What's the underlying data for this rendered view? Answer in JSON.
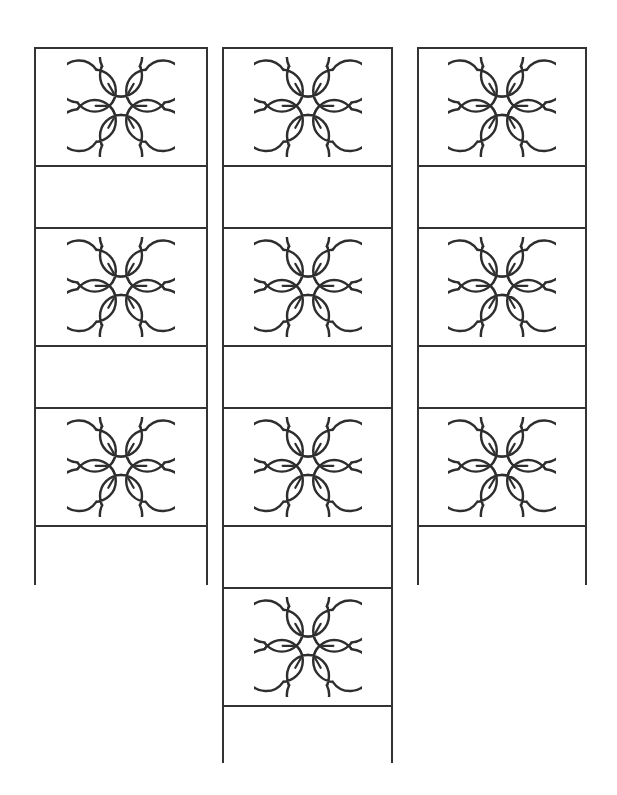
{
  "page": {
    "background_color": "#ffffff",
    "outline_color": "#333333",
    "flower_stroke_color": "#2e2e2e",
    "width": 617,
    "height": 795
  },
  "worksheet": {
    "strips": [
      {
        "name": "left-strip",
        "x": 34,
        "y": 47,
        "width": 174,
        "height": 538,
        "cells": [
          {
            "type": "flower",
            "icon": "flower-icon",
            "label": ""
          },
          {
            "type": "blank",
            "icon": "",
            "label": ""
          },
          {
            "type": "flower",
            "icon": "flower-icon",
            "label": ""
          },
          {
            "type": "blank",
            "icon": "",
            "label": ""
          },
          {
            "type": "flower",
            "icon": "flower-icon",
            "label": ""
          },
          {
            "type": "blank",
            "icon": "",
            "label": ""
          }
        ]
      },
      {
        "name": "middle-strip",
        "x": 222,
        "y": 47,
        "width": 171,
        "height": 716,
        "cells": [
          {
            "type": "flower",
            "icon": "flower-icon",
            "label": ""
          },
          {
            "type": "blank",
            "icon": "",
            "label": ""
          },
          {
            "type": "flower",
            "icon": "flower-icon",
            "label": ""
          },
          {
            "type": "blank",
            "icon": "",
            "label": ""
          },
          {
            "type": "flower",
            "icon": "flower-icon",
            "label": ""
          },
          {
            "type": "blank",
            "icon": "",
            "label": ""
          },
          {
            "type": "flower",
            "icon": "flower-icon",
            "label": ""
          },
          {
            "type": "blank",
            "icon": "",
            "label": ""
          }
        ]
      },
      {
        "name": "right-strip",
        "x": 417,
        "y": 47,
        "width": 170,
        "height": 538,
        "cells": [
          {
            "type": "flower",
            "icon": "flower-icon",
            "label": ""
          },
          {
            "type": "blank",
            "icon": "",
            "label": ""
          },
          {
            "type": "flower",
            "icon": "flower-icon",
            "label": ""
          },
          {
            "type": "blank",
            "icon": "",
            "label": ""
          },
          {
            "type": "flower",
            "icon": "flower-icon",
            "label": ""
          },
          {
            "type": "blank",
            "icon": "",
            "label": ""
          }
        ]
      }
    ]
  }
}
